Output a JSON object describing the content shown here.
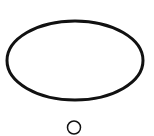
{
  "diagram": {
    "type": "thought-bubble",
    "background": "#ffffff",
    "stroke_color": "#111111",
    "main_ellipse": {
      "cx": 75,
      "cy": 60.5,
      "rx": 68,
      "ry": 39.5,
      "stroke_width": 3
    },
    "small_circle": {
      "cx": 74,
      "cy": 127.5,
      "r": 6.5,
      "stroke_width": 1.5
    }
  }
}
